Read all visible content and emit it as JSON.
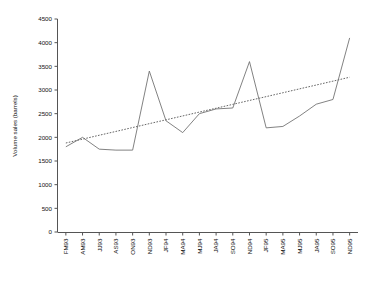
{
  "chart_data": {
    "type": "line",
    "title": "",
    "xlabel": "",
    "ylabel": "Volume sales (barrels)",
    "ylim": [
      0,
      4500
    ],
    "ytick_step": 500,
    "yticks": [
      0,
      500,
      1000,
      1500,
      2000,
      2500,
      3000,
      3500,
      4000,
      4500
    ],
    "grid": false,
    "legend": "none",
    "categories": [
      "FM93",
      "AM93",
      "JJ93",
      "AS93",
      "ON93",
      "ND93",
      "JF94",
      "MA94",
      "MJ94",
      "JA94",
      "SO94",
      "ND94",
      "JF95",
      "MA95",
      "MJ95",
      "JA95",
      "SO95",
      "ND95"
    ],
    "series": [
      {
        "name": "Volume sales",
        "style": "solid",
        "color": "#6b6b6b",
        "values": [
          1800,
          2000,
          1750,
          1730,
          1730,
          3400,
          2350,
          2100,
          2500,
          2600,
          2620,
          3600,
          2200,
          2230,
          2450,
          2700,
          2800,
          4100
        ]
      },
      {
        "name": "Linear trend",
        "style": "dotted",
        "color": "#4a4a4a",
        "values": [
          1880,
          1962,
          2044,
          2125,
          2207,
          2289,
          2370,
          2452,
          2534,
          2615,
          2697,
          2779,
          2860,
          2942,
          3024,
          3105,
          3187,
          3270
        ]
      }
    ]
  },
  "axes": {
    "y_title": "Volume sales (barrels)"
  }
}
